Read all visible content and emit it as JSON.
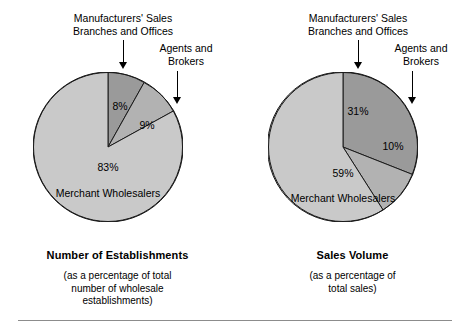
{
  "figure": {
    "background": "#ffffff",
    "divider_color": "#8c8c8c"
  },
  "colors": {
    "dark_slice": "#9a9a9a",
    "mid_slice": "#b2b2b2",
    "light_slice": "#c9c9c9",
    "outline": "#1a1a1a",
    "text": "#000000"
  },
  "panels": [
    {
      "id": "number-of-establishments",
      "callout_msbo": "Manufacturers' Sales\nBranches and Offices",
      "callout_agents": "Agents and\nBrokers",
      "caption_title": "Number of Establishments",
      "caption_sub": "(as a percentage of total\nnumber of wholesale\nestablishments)",
      "merchant_label": "Merchant Wholesalers",
      "labels": {
        "msbo": "8%",
        "agents": "9%",
        "merchant": "83%"
      }
    },
    {
      "id": "sales-volume",
      "callout_msbo": "Manufacturers' Sales\nBranches and Offices",
      "callout_agents": "Agents and\nBrokers",
      "caption_title": "Sales Volume",
      "caption_sub": "(as a percentage of\ntotal sales)",
      "merchant_label": "Merchant Wholesalers",
      "labels": {
        "msbo": "31%",
        "agents": "10%",
        "merchant": "59%"
      }
    }
  ],
  "chart_data": [
    {
      "type": "pie",
      "title": "Number of Establishments",
      "subtitle": "(as a percentage of total number of wholesale establishments)",
      "categories": [
        "Manufacturers' Sales Branches and Offices",
        "Agents and Brokers",
        "Merchant Wholesalers"
      ],
      "values": [
        8,
        9,
        83
      ],
      "value_labels": [
        "8%",
        "9%",
        "83%"
      ],
      "colors": [
        "#9a9a9a",
        "#b2b2b2",
        "#c9c9c9"
      ],
      "start_angle_deg": 0,
      "direction": "clockwise",
      "legend": "annotated-callouts",
      "xlabel": "",
      "ylabel": ""
    },
    {
      "type": "pie",
      "title": "Sales Volume",
      "subtitle": "(as a percentage of total sales)",
      "categories": [
        "Manufacturers' Sales Branches and Offices",
        "Agents and Brokers",
        "Merchant Wholesalers"
      ],
      "values": [
        31,
        10,
        59
      ],
      "value_labels": [
        "31%",
        "10%",
        "59%"
      ],
      "colors": [
        "#9a9a9a",
        "#b2b2b2",
        "#c9c9c9"
      ],
      "start_angle_deg": 0,
      "direction": "clockwise",
      "legend": "annotated-callouts",
      "xlabel": "",
      "ylabel": ""
    }
  ]
}
